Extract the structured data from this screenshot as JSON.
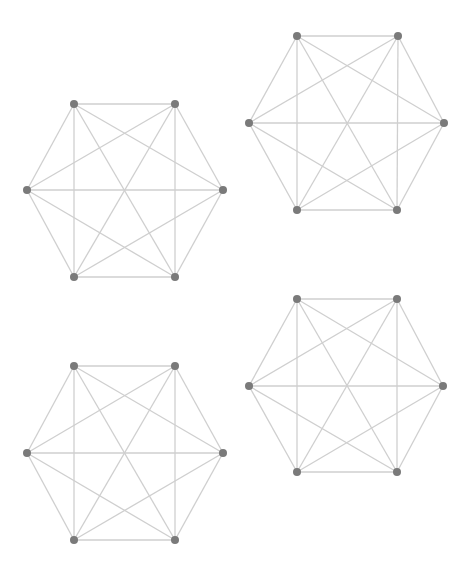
{
  "figure": {
    "width": 474,
    "height": 583,
    "colors": {
      "background": "#ffffff",
      "edge": "#cfcfcf",
      "node": "#7a7a7a"
    },
    "node_radius": 4
  },
  "graphs": [
    {
      "id": "graph-top-left",
      "type": "complete-graph-K6",
      "nodes": [
        {
          "id": "TL",
          "x": 74,
          "y": 104
        },
        {
          "id": "TR",
          "x": 175,
          "y": 104
        },
        {
          "id": "L",
          "x": 27,
          "y": 190
        },
        {
          "id": "R",
          "x": 223,
          "y": 190
        },
        {
          "id": "BL",
          "x": 74,
          "y": 277
        },
        {
          "id": "BR",
          "x": 175,
          "y": 277
        }
      ]
    },
    {
      "id": "graph-top-right",
      "type": "complete-graph-K6",
      "nodes": [
        {
          "id": "TL",
          "x": 297,
          "y": 36
        },
        {
          "id": "TR",
          "x": 398,
          "y": 36
        },
        {
          "id": "L",
          "x": 249,
          "y": 123
        },
        {
          "id": "R",
          "x": 444,
          "y": 123
        },
        {
          "id": "BL",
          "x": 297,
          "y": 210
        },
        {
          "id": "BR",
          "x": 397,
          "y": 210
        }
      ]
    },
    {
      "id": "graph-bottom-left",
      "type": "complete-graph-K6",
      "nodes": [
        {
          "id": "TL",
          "x": 74,
          "y": 366
        },
        {
          "id": "TR",
          "x": 175,
          "y": 366
        },
        {
          "id": "L",
          "x": 27,
          "y": 453
        },
        {
          "id": "R",
          "x": 223,
          "y": 453
        },
        {
          "id": "BL",
          "x": 74,
          "y": 540
        },
        {
          "id": "BR",
          "x": 175,
          "y": 540
        }
      ]
    },
    {
      "id": "graph-bottom-right",
      "type": "complete-graph-K6",
      "nodes": [
        {
          "id": "TL",
          "x": 297,
          "y": 299
        },
        {
          "id": "TR",
          "x": 397,
          "y": 299
        },
        {
          "id": "L",
          "x": 249,
          "y": 386
        },
        {
          "id": "R",
          "x": 443,
          "y": 386
        },
        {
          "id": "BL",
          "x": 297,
          "y": 472
        },
        {
          "id": "BR",
          "x": 397,
          "y": 472
        }
      ]
    }
  ],
  "edges_per_graph": [
    [
      "TL",
      "TR"
    ],
    [
      "TR",
      "R"
    ],
    [
      "R",
      "BR"
    ],
    [
      "BR",
      "BL"
    ],
    [
      "BL",
      "L"
    ],
    [
      "L",
      "TL"
    ],
    [
      "TL",
      "BL"
    ],
    [
      "TR",
      "BR"
    ],
    [
      "L",
      "R"
    ],
    [
      "TL",
      "R"
    ],
    [
      "TL",
      "BR"
    ],
    [
      "TR",
      "L"
    ],
    [
      "TR",
      "BL"
    ],
    [
      "L",
      "BR"
    ],
    [
      "R",
      "BL"
    ]
  ]
}
